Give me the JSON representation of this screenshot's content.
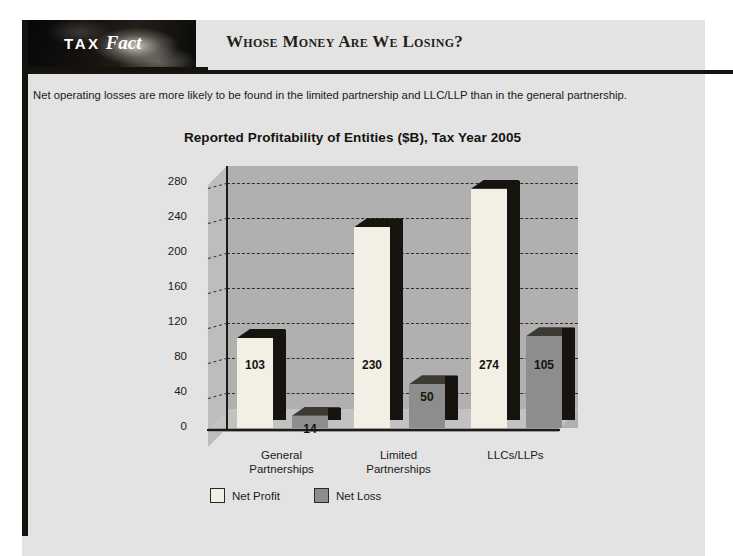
{
  "page": {
    "background_color": "#ffffff",
    "sheet_color": "#e3e3e3",
    "rule_color": "#16130f"
  },
  "header": {
    "logo_primary": "TAX",
    "logo_secondary": "Fact",
    "title": "Whose Money Are We Losing?"
  },
  "intro": {
    "text": "Net operating losses are more likely to be found in the limited partnership and LLC/LLP than in the general partnership."
  },
  "chart_data": {
    "type": "bar",
    "title": "Reported Profitability of Entities ($B), Tax Year 2005",
    "xlabel": "",
    "ylabel": "",
    "ylim": [
      0,
      300
    ],
    "yticks": [
      0,
      40,
      80,
      120,
      160,
      200,
      240,
      280
    ],
    "ytick_labels": [
      "0",
      "40",
      "80",
      "120",
      "160",
      "200",
      "240",
      "280"
    ],
    "grid": true,
    "grid_style": "dashed",
    "legend_position": "bottom-left",
    "categories": [
      "General Partnerships",
      "Limited Partnerships",
      "LLCs/LLPs"
    ],
    "category_lines": [
      [
        "General",
        "Partnerships"
      ],
      [
        "Limited",
        "Partnerships"
      ],
      [
        "LLCs/LLPs",
        ""
      ]
    ],
    "series": [
      {
        "name": "Net Profit",
        "color": "#f2efe4",
        "values": [
          103,
          230,
          274
        ],
        "labels": [
          "103",
          "230",
          "274"
        ]
      },
      {
        "name": "Net Loss",
        "color": "#8d8d8d",
        "values": [
          14,
          50,
          105
        ],
        "labels": [
          "14",
          "50",
          "105"
        ]
      }
    ]
  },
  "legend": {
    "items": [
      {
        "label": "Net Profit",
        "color": "#f2efe4"
      },
      {
        "label": "Net Loss",
        "color": "#8d8d8d"
      }
    ]
  }
}
